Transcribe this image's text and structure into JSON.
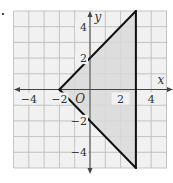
{
  "chart_data": {
    "type": "line",
    "title": "",
    "xlabel": "x",
    "ylabel": "y",
    "xlim": [
      -5,
      5
    ],
    "ylim": [
      -5,
      5
    ],
    "grid": true,
    "origin_label": "O",
    "x_ticks": [
      -4,
      -2,
      2,
      4
    ],
    "y_ticks": [
      4,
      2,
      -2,
      -4
    ],
    "x_tick_labels": [
      "−4",
      "−2",
      "2",
      "4"
    ],
    "y_tick_labels": [
      "4",
      "2",
      "−2",
      "−4"
    ],
    "series": [
      {
        "name": "boundary y = x + 2",
        "x": [
          -2,
          3
        ],
        "y": [
          0,
          5
        ]
      },
      {
        "name": "boundary y = -x - 2",
        "x": [
          -2,
          3
        ],
        "y": [
          0,
          -5
        ]
      },
      {
        "name": "boundary x = 3",
        "x": [
          3,
          3
        ],
        "y": [
          5,
          -5
        ]
      }
    ],
    "shaded_region": {
      "vertices": [
        [
          -2,
          0
        ],
        [
          3,
          5
        ],
        [
          3,
          -5
        ]
      ],
      "color": "#d9d9d9"
    },
    "colors": {
      "grid": "#b8b8b8",
      "lines": "#111111",
      "shade": "#d9d9d9",
      "axis": "#444444"
    }
  }
}
